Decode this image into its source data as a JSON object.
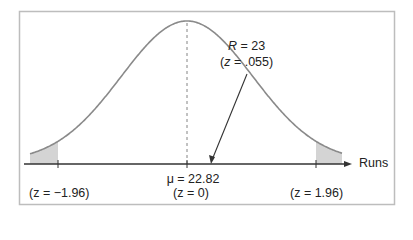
{
  "chart_data": {
    "type": "line",
    "title": "",
    "xlabel": "Runs",
    "ylabel": "",
    "mean": {
      "symbol": "μ",
      "value": 22.82,
      "z": 0
    },
    "critical_values": [
      {
        "z": -1.96,
        "label": "(z = −1.96)"
      },
      {
        "z": 1.96,
        "label": "(z = 1.96)"
      }
    ],
    "observed": {
      "symbol": "R",
      "value": 23,
      "z": 0.055
    },
    "grid": false,
    "shaded_tails": true
  },
  "labels": {
    "x_axis": "Runs",
    "mean_value": "μ = 22.82",
    "mean_z": "(z = 0)",
    "left_crit": "(z = −1.96)",
    "right_crit": "(z = 1.96)",
    "observed_R_sym": "R",
    "observed_R_rest": " = 23",
    "observed_z_sym": "z",
    "observed_z_rest": " = .055)",
    "observed_z_open": "("
  },
  "colors": {
    "curve": "#8a8a8a",
    "axis": "#333333",
    "frame": "#bdbdbd",
    "tail_fill": "#d4d4d4"
  }
}
